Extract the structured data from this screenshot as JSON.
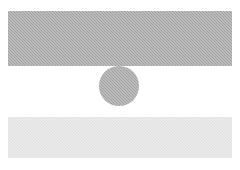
{
  "canvas": {
    "width": 240,
    "height": 170,
    "background_color": "#ffffff"
  },
  "shapes": [
    {
      "name": "top-bar",
      "kind": "rectangle",
      "fill_color": "#a9a9a9",
      "texture": "dither-halftone",
      "x": 8,
      "y": 11,
      "width": 224,
      "height": 55
    },
    {
      "name": "center-circle",
      "kind": "circle",
      "fill_color": "#a9a9a9",
      "texture": "dither-halftone",
      "center_x": 119,
      "center_y": 86,
      "diameter": 40
    },
    {
      "name": "bottom-bar",
      "kind": "rectangle",
      "fill_color": "#e3e3e3",
      "texture": "dither-halftone",
      "x": 8,
      "y": 117,
      "width": 224,
      "height": 41
    }
  ]
}
